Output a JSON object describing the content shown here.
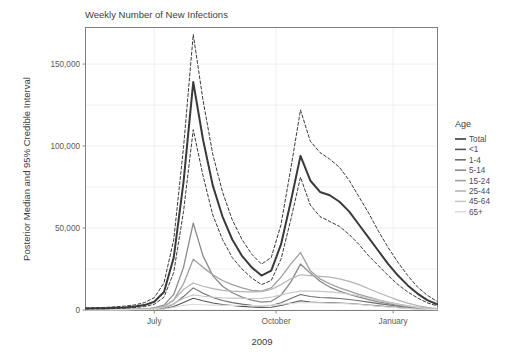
{
  "chart_data": {
    "type": "line",
    "title": "Weekly Number of New Infections",
    "xlabel": "2009",
    "ylabel": "Posterior Median and 95% Credible Interval",
    "grid": true,
    "legend_position": "right",
    "legend_title": "Age",
    "xlim": [
      0,
      36
    ],
    "ylim": [
      0,
      172000
    ],
    "yticks": [
      0,
      50000,
      100000,
      150000
    ],
    "ytick_labels": [
      "0",
      "50,000",
      "100,000",
      "150,000"
    ],
    "xticks": [
      7.0,
      19.5,
      31.5
    ],
    "xtick_labels": [
      "July",
      "October",
      "January"
    ],
    "x": [
      0,
      1,
      2,
      3,
      4,
      5,
      6,
      7,
      8,
      9,
      10,
      11,
      12,
      13,
      14,
      15,
      16,
      17,
      18,
      19,
      20,
      21,
      22,
      23,
      24,
      25,
      26,
      27,
      28,
      29,
      30,
      31,
      32,
      33,
      34,
      35,
      36
    ],
    "series": [
      {
        "name": "Total",
        "color": "#3a3a3a",
        "width": 2.0,
        "dash": "none",
        "values": [
          900,
          1000,
          1100,
          1300,
          1600,
          2100,
          3000,
          5000,
          11000,
          32000,
          78000,
          139000,
          104000,
          76000,
          57000,
          43000,
          33000,
          26000,
          21000,
          24000,
          40000,
          66000,
          94000,
          79000,
          72000,
          70000,
          66000,
          60000,
          52000,
          44000,
          36000,
          28000,
          21000,
          15000,
          10000,
          6000,
          3500
        ]
      },
      {
        "name": "Total upper 95% CI",
        "color": "#3a3a3a",
        "width": 1.0,
        "dash": "3,2.2",
        "values": [
          1300,
          1400,
          1600,
          1900,
          2400,
          3100,
          4500,
          7500,
          16500,
          43000,
          99000,
          168000,
          128000,
          95000,
          72000,
          55000,
          43000,
          34000,
          28000,
          32000,
          52000,
          86000,
          122000,
          103000,
          96000,
          92000,
          87000,
          79000,
          69000,
          59000,
          48000,
          38000,
          29000,
          21000,
          14000,
          9000,
          5200
        ]
      },
      {
        "name": "Total lower 95% CI",
        "color": "#3a3a3a",
        "width": 1.0,
        "dash": "3,2.2",
        "values": [
          650,
          700,
          780,
          900,
          1150,
          1500,
          2100,
          3500,
          7800,
          23000,
          60000,
          110000,
          82000,
          58000,
          43000,
          32000,
          25000,
          19500,
          15500,
          18000,
          31000,
          55000,
          81000,
          64000,
          57000,
          54000,
          51000,
          46000,
          40000,
          33000,
          27000,
          21000,
          15500,
          11000,
          7400,
          4400,
          2500
        ]
      },
      {
        "name": "<1",
        "color": "#555555",
        "width": 1.1,
        "dash": "none",
        "values": [
          60,
          70,
          80,
          95,
          120,
          160,
          230,
          380,
          800,
          2100,
          4600,
          7200,
          5600,
          4300,
          3400,
          2700,
          2200,
          1800,
          1500,
          1700,
          2700,
          4200,
          5600,
          4900,
          4600,
          4500,
          4300,
          4000,
          3500,
          3000,
          2500,
          2000,
          1500,
          1100,
          750,
          450,
          260
        ]
      },
      {
        "name": "1-4",
        "color": "#6e6e6e",
        "width": 1.1,
        "dash": "none",
        "values": [
          90,
          100,
          115,
          140,
          180,
          240,
          350,
          580,
          1300,
          3600,
          8200,
          13500,
          10200,
          7600,
          5800,
          4500,
          3600,
          2900,
          2400,
          2700,
          4400,
          7000,
          9500,
          8200,
          7600,
          7400,
          7000,
          6400,
          5600,
          4800,
          3900,
          3100,
          2300,
          1650,
          1100,
          680,
          390
        ]
      },
      {
        "name": "5-14",
        "color": "#8a8a8a",
        "width": 1.3,
        "dash": "none",
        "values": [
          180,
          200,
          230,
          280,
          360,
          490,
          720,
          1250,
          3000,
          9500,
          26000,
          53000,
          33000,
          21000,
          14500,
          10500,
          7800,
          6000,
          4800,
          5300,
          9000,
          17000,
          28000,
          22500,
          17500,
          14000,
          11500,
          9500,
          7800,
          6300,
          5000,
          3900,
          2900,
          2050,
          1350,
          820,
          460
        ]
      },
      {
        "name": "15-24",
        "color": "#a0a0a0",
        "width": 1.3,
        "dash": "none",
        "values": [
          140,
          155,
          175,
          210,
          270,
          360,
          530,
          900,
          2050,
          6200,
          16000,
          31000,
          26000,
          21500,
          18000,
          15500,
          13500,
          12000,
          11500,
          13500,
          20000,
          28000,
          35000,
          24000,
          19000,
          16000,
          13500,
          11500,
          9500,
          7800,
          6200,
          4800,
          3600,
          2500,
          1650,
          1000,
          560
        ]
      },
      {
        "name": "25-44",
        "color": "#b4b4b4",
        "width": 1.2,
        "dash": "none",
        "values": [
          160,
          175,
          195,
          235,
          300,
          400,
          580,
          980,
          2200,
          6000,
          12500,
          16500,
          14500,
          13000,
          12000,
          11500,
          11200,
          11000,
          11200,
          12500,
          15500,
          19000,
          21500,
          21000,
          20500,
          20000,
          19000,
          17500,
          15500,
          13000,
          10500,
          8200,
          6000,
          4200,
          2700,
          1600,
          900
        ]
      },
      {
        "name": "45-64",
        "color": "#c8c8c8",
        "width": 1.2,
        "dash": "none",
        "values": [
          120,
          130,
          145,
          175,
          220,
          295,
          430,
          720,
          1550,
          3900,
          7200,
          9200,
          8400,
          7800,
          7400,
          7200,
          7100,
          7000,
          7100,
          7800,
          9200,
          10500,
          11500,
          11500,
          11300,
          11000,
          10500,
          9700,
          8600,
          7300,
          5900,
          4600,
          3400,
          2400,
          1550,
          930,
          520
        ]
      },
      {
        "name": "65+",
        "color": "#dcdcdc",
        "width": 1.1,
        "dash": "none",
        "values": [
          50,
          55,
          62,
          75,
          95,
          125,
          180,
          300,
          640,
          1550,
          2800,
          3500,
          3200,
          3000,
          2850,
          2800,
          2750,
          2720,
          2760,
          3000,
          3500,
          4000,
          4400,
          4400,
          4350,
          4250,
          4050,
          3750,
          3350,
          2850,
          2300,
          1800,
          1320,
          930,
          600,
          360,
          200
        ]
      }
    ],
    "legend_entries": [
      {
        "label": "Total",
        "color": "#3a3a3a"
      },
      {
        "label": "<1",
        "color": "#555555"
      },
      {
        "label": "1-4",
        "color": "#6e6e6e"
      },
      {
        "label": "5-14",
        "color": "#8a8a8a"
      },
      {
        "label": "15-24",
        "color": "#a0a0a0"
      },
      {
        "label": "25-44",
        "color": "#b4b4b4"
      },
      {
        "label": "45-64",
        "color": "#c8c8c8"
      },
      {
        "label": "65+",
        "color": "#dcdcdc"
      }
    ]
  }
}
